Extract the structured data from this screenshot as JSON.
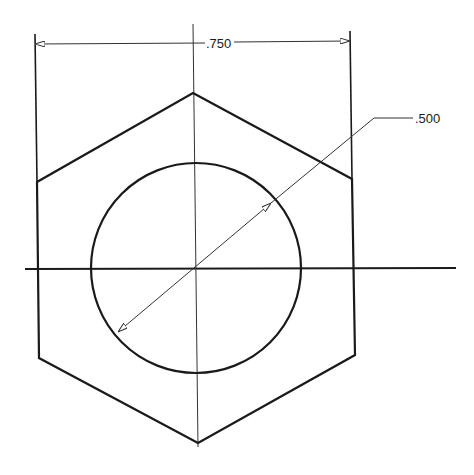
{
  "drawing": {
    "type": "hex-nut-top-view",
    "colors": {
      "line": "#1a1a1a",
      "thin": "#333333",
      "background": "#ffffff"
    },
    "hexagon": {
      "points": [
        [
          193,
          93
        ],
        [
          352,
          179
        ],
        [
          355,
          355
        ],
        [
          198,
          443
        ],
        [
          39,
          358
        ],
        [
          37,
          182
        ]
      ]
    },
    "circle": {
      "cx": 196,
      "cy": 268,
      "r": 105
    },
    "centerlines": {
      "horizontal": {
        "x1": 25,
        "y1": 269,
        "x2": 456,
        "y2": 268
      },
      "vertical": {
        "x1": 193,
        "y1": 24,
        "x2": 198,
        "y2": 447
      }
    },
    "dimensions": {
      "width": {
        "label": ".750",
        "ext_left": {
          "x": 35,
          "y1": 34,
          "y2": 182
        },
        "ext_right": {
          "x": 350,
          "y1": 31,
          "y2": 179
        },
        "line_y_left": 44,
        "line_y_right": 41
      },
      "diameter": {
        "label": ".500",
        "arrow_start": [
          118,
          332
        ],
        "arrow_end": [
          271,
          203
        ],
        "knee": [
          374,
          118
        ],
        "shelf_end": [
          413,
          118
        ]
      }
    }
  }
}
